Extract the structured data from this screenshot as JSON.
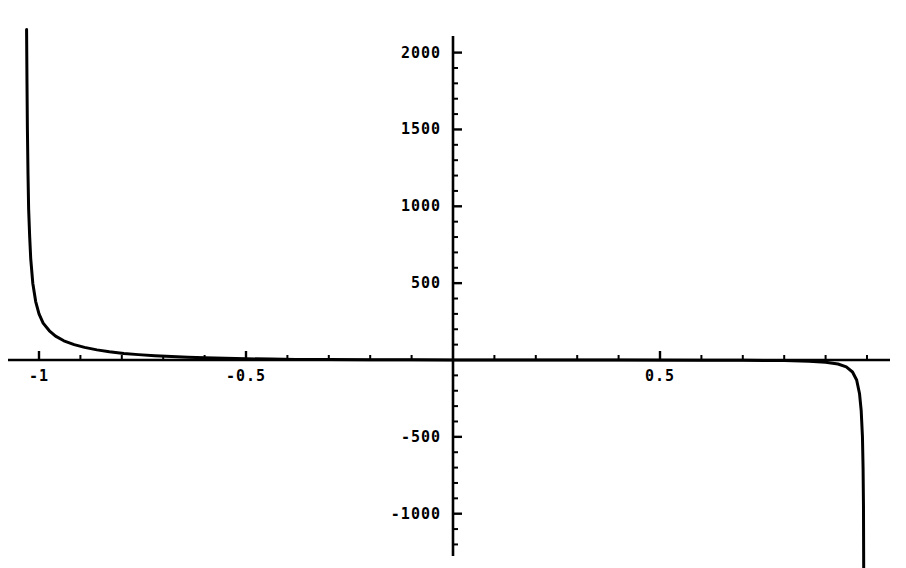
{
  "chart_data": {
    "type": "line",
    "title": "",
    "subtitle": "",
    "xlabel": "",
    "ylabel": "",
    "grid": false,
    "legend": false,
    "legend_position": "none",
    "axis_style": "crossed-at-origin",
    "xlim": [
      -1.09,
      1.055
    ],
    "ylim": [
      -1350,
      2150
    ],
    "x_ticks_major": [
      -1,
      -0.5,
      0.5
    ],
    "x_tick_labels": [
      "-1",
      "-0.5",
      "0.5"
    ],
    "x_tick_minor_step": 0.1,
    "y_ticks_major": [
      2000,
      1500,
      1000,
      500,
      -500,
      -1000
    ],
    "y_tick_labels": [
      "2000",
      "1500",
      "1000",
      "500",
      "-500",
      "-1000"
    ],
    "y_tick_minor_step": 100,
    "origin_label_hidden": true,
    "series": [
      {
        "name": "curve",
        "color": "#000000",
        "line_width": 3,
        "asymptotes_x": [
          -1.032,
          0.992
        ],
        "description": "steeply decaying branch from upper-left falling to the x-axis, flat along y=0 across the middle, then plunging vertically downward near x=0.99",
        "points": [
          [
            -1.03,
            2150
          ],
          [
            -1.029,
            1800
          ],
          [
            -1.028,
            1500
          ],
          [
            -1.0265,
            1200
          ],
          [
            -1.025,
            980
          ],
          [
            -1.0225,
            800
          ],
          [
            -1.02,
            660
          ],
          [
            -1.015,
            500
          ],
          [
            -1.008,
            380
          ],
          [
            -1.0,
            300
          ],
          [
            -0.99,
            240
          ],
          [
            -0.975,
            190
          ],
          [
            -0.96,
            155
          ],
          [
            -0.94,
            125
          ],
          [
            -0.915,
            100
          ],
          [
            -0.89,
            82
          ],
          [
            -0.86,
            66
          ],
          [
            -0.83,
            54
          ],
          [
            -0.795,
            43
          ],
          [
            -0.76,
            35
          ],
          [
            -0.72,
            28
          ],
          [
            -0.68,
            22
          ],
          [
            -0.64,
            18
          ],
          [
            -0.6,
            14
          ],
          [
            -0.55,
            11
          ],
          [
            -0.5,
            8
          ],
          [
            -0.44,
            6
          ],
          [
            -0.38,
            4
          ],
          [
            -0.3,
            3
          ],
          [
            -0.2,
            2
          ],
          [
            -0.1,
            1
          ],
          [
            0.0,
            0
          ],
          [
            0.2,
            0
          ],
          [
            0.4,
            0
          ],
          [
            0.6,
            -1
          ],
          [
            0.7,
            -2
          ],
          [
            0.8,
            -4
          ],
          [
            0.86,
            -8
          ],
          [
            0.9,
            -14
          ],
          [
            0.93,
            -26
          ],
          [
            0.95,
            -45
          ],
          [
            0.965,
            -78
          ],
          [
            0.975,
            -130
          ],
          [
            0.982,
            -220
          ],
          [
            0.986,
            -330
          ],
          [
            0.989,
            -500
          ],
          [
            0.9905,
            -700
          ],
          [
            0.9915,
            -950
          ],
          [
            0.992,
            -1350
          ]
        ]
      }
    ]
  },
  "axes": {
    "x_axis_name": "horizontal-axis",
    "y_axis_name": "vertical-axis",
    "color": "#000000"
  }
}
